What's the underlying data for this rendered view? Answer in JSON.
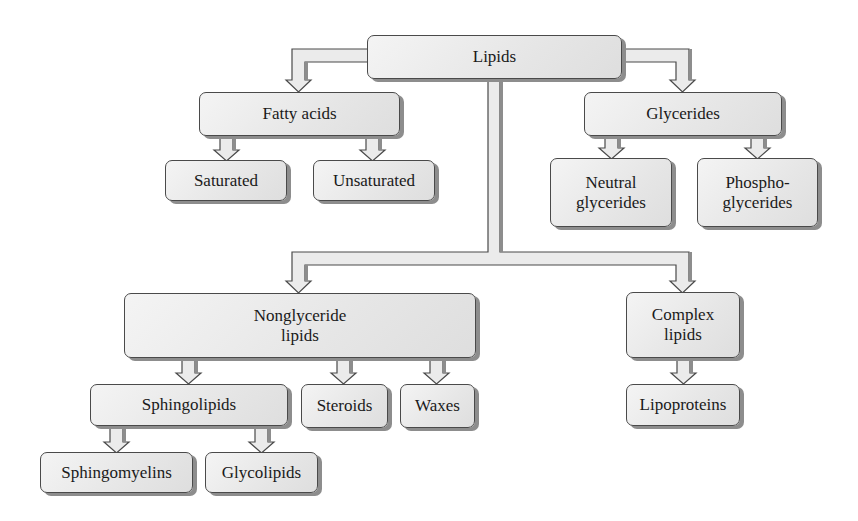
{
  "diagram": {
    "colors": {
      "box_fill": "#e8e8e8",
      "box_border": "#4a4a4a",
      "shadow": "#8d8d8d",
      "arrow_fill": "#ebebeb",
      "text": "#1a1a1a"
    },
    "nodes": {
      "lipids": {
        "label": "Lipids"
      },
      "fatty_acids": {
        "label": "Fatty acids"
      },
      "glycerides": {
        "label": "Glycerides"
      },
      "saturated": {
        "label": "Saturated"
      },
      "unsaturated": {
        "label": "Unsaturated"
      },
      "neutral_glycerides": {
        "line1": "Neutral",
        "line2": "glycerides"
      },
      "phosphoglycerides": {
        "line1": "Phospho-",
        "line2": "glycerides"
      },
      "nonglyceride_lipids": {
        "line1": "Nonglyceride",
        "line2": "lipids"
      },
      "complex_lipids": {
        "line1": "Complex",
        "line2": "lipids"
      },
      "sphingolipids": {
        "label": "Sphingolipids"
      },
      "steroids": {
        "label": "Steroids"
      },
      "waxes": {
        "label": "Waxes"
      },
      "lipoproteins": {
        "label": "Lipoproteins"
      },
      "sphingomyelins": {
        "label": "Sphingomyelins"
      },
      "glycolipids": {
        "label": "Glycolipids"
      }
    },
    "edges": [
      [
        "Lipids",
        "Fatty acids"
      ],
      [
        "Lipids",
        "Glycerides"
      ],
      [
        "Lipids",
        "Nonglyceride lipids"
      ],
      [
        "Lipids",
        "Complex lipids"
      ],
      [
        "Fatty acids",
        "Saturated"
      ],
      [
        "Fatty acids",
        "Unsaturated"
      ],
      [
        "Glycerides",
        "Neutral glycerides"
      ],
      [
        "Glycerides",
        "Phosphoglycerides"
      ],
      [
        "Nonglyceride lipids",
        "Sphingolipids"
      ],
      [
        "Nonglyceride lipids",
        "Steroids"
      ],
      [
        "Nonglyceride lipids",
        "Waxes"
      ],
      [
        "Complex lipids",
        "Lipoproteins"
      ],
      [
        "Sphingolipids",
        "Sphingomyelins"
      ],
      [
        "Sphingolipids",
        "Glycolipids"
      ]
    ]
  }
}
